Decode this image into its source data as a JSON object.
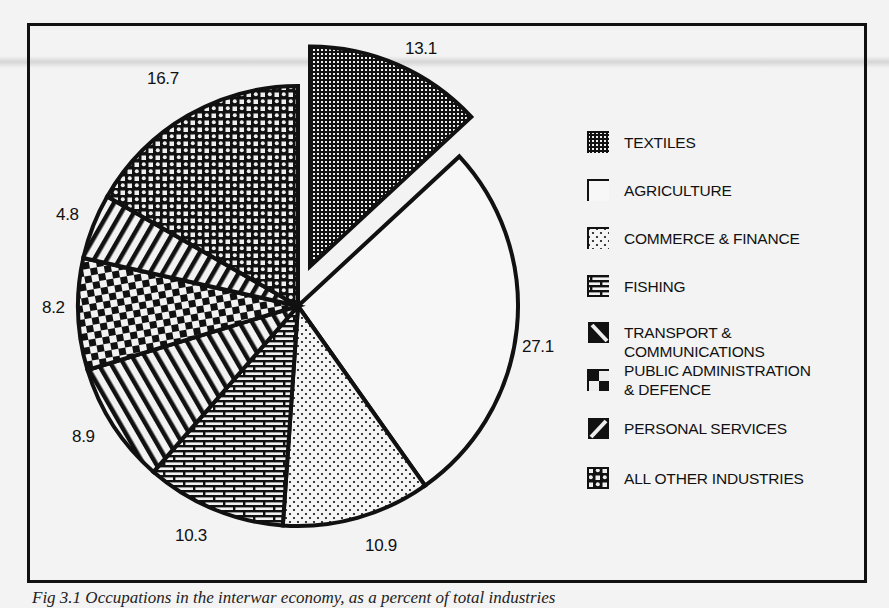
{
  "chart_data": {
    "type": "pie",
    "title": "",
    "unit": "percent",
    "start_angle": "12 o'clock",
    "direction": "clockwise",
    "categories": [
      "TEXTILES",
      "AGRICULTURE",
      "COMMERCE & FINANCE",
      "FISHING",
      "TRANSPORT & COMMUNICATIONS",
      "PUBLIC ADMINISTRATION & DEFENCE",
      "PERSONAL SERVICES",
      "ALL OTHER INDUSTRIES"
    ],
    "values": [
      13.1,
      27.1,
      10.9,
      10.3,
      8.9,
      8.2,
      4.8,
      16.7
    ],
    "exploded": [
      "TEXTILES"
    ],
    "legend_position": "right",
    "slice_labels": [
      "13.1",
      "27.1",
      "10.9",
      "10.3",
      "8.9",
      "8.2",
      "4.8",
      "16.7"
    ]
  },
  "labels": {
    "textiles": "13.1",
    "agriculture": "27.1",
    "commerce": "10.9",
    "fishing": "10.3",
    "transport": "8.9",
    "public_admin": "8.2",
    "personal": "4.8",
    "other": "16.7"
  },
  "legend": [
    {
      "label": "TEXTILES",
      "pattern": "dense-dots-dark"
    },
    {
      "label": "AGRICULTURE",
      "pattern": "blank"
    },
    {
      "label": "COMMERCE & FINANCE",
      "pattern": "sparse-dots"
    },
    {
      "label": "FISHING",
      "pattern": "brick"
    },
    {
      "label": "TRANSPORT &\nCOMMUNICATIONS",
      "pattern": "diagonal-down"
    },
    {
      "label": "PUBLIC ADMINISTRATION\n& DEFENCE",
      "pattern": "checker"
    },
    {
      "label": "PERSONAL SERVICES",
      "pattern": "diagonal-up"
    },
    {
      "label": "ALL OTHER INDUSTRIES",
      "pattern": "circle-lattice"
    }
  ],
  "caption": "Fig 3.1   Occupations in the interwar economy, as a percent of total industries"
}
